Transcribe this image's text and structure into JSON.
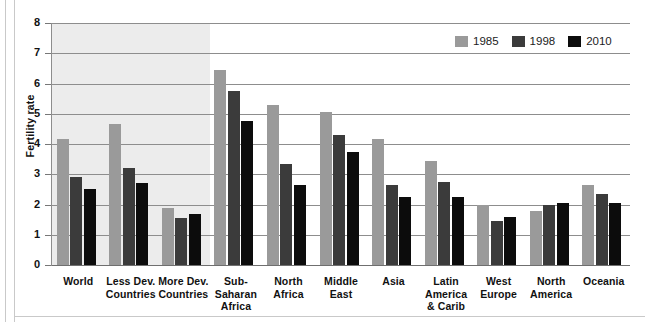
{
  "chart_data": {
    "type": "bar",
    "title": "",
    "xlabel": "",
    "ylabel": "Fertility rate",
    "ylim": [
      0,
      8
    ],
    "yticks": [
      0,
      1,
      2,
      3,
      4,
      5,
      6,
      7,
      8
    ],
    "grid": true,
    "legend_position": "top-right",
    "categories": [
      "World",
      "Less Dev. Countries",
      "More Dev. Countries",
      "Sub-Saharan Africa",
      "North Africa",
      "Middle East",
      "Asia",
      "Latin America & Carib",
      "West Europe",
      "North America",
      "Oceania"
    ],
    "category_lines": [
      [
        "World"
      ],
      [
        "Less Dev.",
        "Countries"
      ],
      [
        "More Dev.",
        "Countries"
      ],
      [
        "Sub-",
        "Saharan",
        "Africa"
      ],
      [
        "North",
        "Africa"
      ],
      [
        "Middle",
        "East"
      ],
      [
        "Asia"
      ],
      [
        "Latin",
        "America",
        "& Carib"
      ],
      [
        "West",
        "Europe"
      ],
      [
        "North",
        "America"
      ],
      [
        "Oceania"
      ]
    ],
    "series": [
      {
        "name": "1985",
        "color": "#9a9a9a",
        "values": [
          4.15,
          4.65,
          1.9,
          6.45,
          5.3,
          5.05,
          4.15,
          3.45,
          2.0,
          1.8,
          2.65
        ]
      },
      {
        "name": "1998",
        "color": "#3b3b3b",
        "values": [
          2.9,
          3.2,
          1.55,
          5.75,
          3.35,
          4.3,
          2.65,
          2.75,
          1.45,
          2.0,
          2.35
        ]
      },
      {
        "name": "2010",
        "color": "#0c0c0c",
        "values": [
          2.5,
          2.7,
          1.7,
          4.75,
          2.65,
          3.75,
          2.25,
          2.25,
          1.6,
          2.05,
          2.05
        ]
      }
    ]
  },
  "legend": {
    "items": [
      {
        "label": "1985",
        "color": "#9a9a9a"
      },
      {
        "label": "1998",
        "color": "#3b3b3b"
      },
      {
        "label": "2010",
        "color": "#0c0c0c"
      }
    ]
  },
  "axis": {
    "y_label": "Fertility rate",
    "y_ticks": [
      "0",
      "1",
      "2",
      "3",
      "4",
      "5",
      "6",
      "7",
      "8"
    ]
  }
}
